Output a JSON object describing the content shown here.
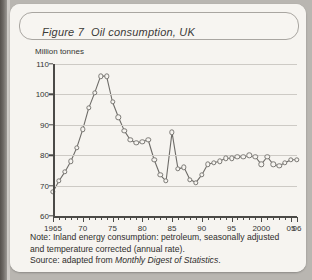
{
  "figure": {
    "number": "Figure 7",
    "title": "Oil consumption, UK"
  },
  "notes": {
    "note_label": "Note:",
    "note_text": " Inland energy consumption: petroleum, seasonally adjusted and temperature corrected (annual rate).",
    "source_label": "Source:",
    "source_prefix": " adapted from ",
    "source_title": "Monthly Digest of Statistics",
    "source_suffix": "."
  },
  "colors": {
    "line": "#6e6c68",
    "marker_stroke": "#7b7975",
    "grid": "#cdcac5",
    "axis": "#4b4a47",
    "paper": "#f6f4f0",
    "page": "#b9b6b1"
  },
  "chart_data": {
    "type": "line",
    "title": "Oil consumption, UK",
    "xlabel": "",
    "ylabel": "Million tonnes",
    "ylim": [
      60,
      110
    ],
    "xlim": [
      1965,
      2006
    ],
    "yticks": [
      60,
      70,
      80,
      90,
      100,
      110
    ],
    "xticks": [
      1965,
      1970,
      1975,
      1980,
      1985,
      1990,
      1995,
      2000,
      2005,
      2006
    ],
    "xtick_labels": [
      "1965",
      "70",
      "75",
      "80",
      "85",
      "90",
      "95",
      "2000",
      "05",
      "06"
    ],
    "grid": true,
    "legend": "none",
    "markers": "open-circle",
    "x": [
      1965,
      1966,
      1967,
      1968,
      1969,
      1970,
      1971,
      1972,
      1973,
      1974,
      1975,
      1976,
      1977,
      1978,
      1979,
      1980,
      1981,
      1982,
      1983,
      1984,
      1985,
      1986,
      1987,
      1988,
      1989,
      1990,
      1991,
      1992,
      1993,
      1994,
      1995,
      1996,
      1997,
      1998,
      1999,
      2000,
      2001,
      2002,
      2003,
      2004,
      2005,
      2006
    ],
    "values": [
      68.0,
      71.5,
      74.5,
      78.0,
      82.5,
      88.5,
      95.5,
      100.5,
      106.0,
      106.0,
      97.5,
      92.5,
      88.0,
      85.0,
      84.0,
      84.5,
      85.0,
      78.5,
      73.5,
      71.5,
      87.5,
      75.5,
      76.0,
      72.0,
      71.0,
      73.5,
      77.0,
      77.5,
      78.0,
      79.0,
      79.0,
      79.5,
      79.5,
      80.0,
      79.5,
      77.0,
      79.5,
      77.0,
      76.5,
      77.5,
      78.5,
      78.5
    ]
  }
}
